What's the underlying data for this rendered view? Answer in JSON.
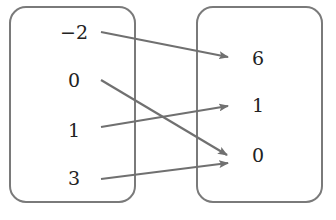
{
  "diagram": {
    "type": "mapping",
    "domain_set": {
      "name": "domain",
      "values": [
        "−2",
        "0",
        "1",
        "3"
      ]
    },
    "range_set": {
      "name": "range",
      "values": [
        "6",
        "1",
        "0"
      ]
    },
    "mappings": [
      {
        "from": "−2",
        "to": "6"
      },
      {
        "from": "0",
        "to": "0"
      },
      {
        "from": "1",
        "to": "1"
      },
      {
        "from": "3",
        "to": "0"
      }
    ],
    "colors": {
      "box_stroke": "#7a7a7a",
      "arrow": "#707070",
      "text": "#222222"
    }
  }
}
